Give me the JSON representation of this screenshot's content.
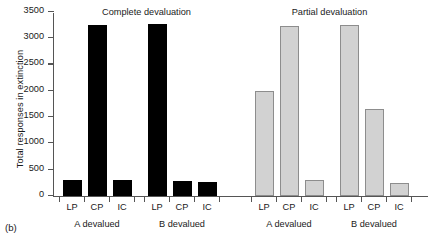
{
  "panel_tag": "(b)",
  "axis": {
    "ylabel": "Total responses in extinction",
    "yticks": [
      "0",
      "500",
      "1000",
      "1500",
      "2000",
      "2500",
      "3000",
      "3500"
    ]
  },
  "panels": [
    {
      "title": "Complete devaluation"
    },
    {
      "title": "Partial devaluation"
    }
  ],
  "groups": [
    {
      "label": "A devalued"
    },
    {
      "label": "B devalued"
    },
    {
      "label": "A devalued"
    },
    {
      "label": "B devalued"
    }
  ],
  "bar_labels": [
    "LP",
    "CP",
    "IC",
    "LP",
    "CP",
    "IC",
    "LP",
    "CP",
    "IC",
    "LP",
    "CP",
    "IC"
  ],
  "chart_data": {
    "type": "bar",
    "title": "",
    "xlabel": "",
    "ylabel": "Total responses in extinction",
    "ylim": [
      0,
      3500
    ],
    "ytick_values": [
      0,
      500,
      1000,
      1500,
      2000,
      2500,
      3000,
      3500
    ],
    "grid": false,
    "legend": "none",
    "panels": [
      {
        "name": "Complete devaluation",
        "style": "filled-black",
        "groups": [
          {
            "name": "A devalued",
            "categories": [
              "LP",
              "CP",
              "IC"
            ],
            "values": [
              300,
              3250,
              300
            ]
          },
          {
            "name": "B devalued",
            "categories": [
              "LP",
              "CP",
              "IC"
            ],
            "values": [
              3270,
              280,
              270
            ]
          }
        ]
      },
      {
        "name": "Partial devaluation",
        "style": "light-gray-outlined",
        "groups": [
          {
            "name": "A devalued",
            "categories": [
              "LP",
              "CP",
              "IC"
            ],
            "values": [
              2000,
              3230,
              300
            ]
          },
          {
            "name": "B devalued",
            "categories": [
              "LP",
              "CP",
              "IC"
            ],
            "values": [
              3260,
              1660,
              250
            ]
          }
        ]
      }
    ]
  },
  "colors": {
    "complete_bar": "#000000",
    "partial_bar_fill": "#d2d2d2",
    "partial_bar_edge": "#8d8d8d",
    "axis": "#555555",
    "text": "#1a1a1a"
  }
}
